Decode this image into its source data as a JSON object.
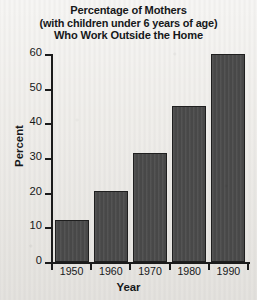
{
  "chart_data": {
    "type": "bar",
    "title": "Percentage of Mothers (with children under 6 years of age) Who Work Outside the Home",
    "title_lines": [
      "Percentage of Mothers",
      "(with children under 6 years of age)",
      "Who Work Outside the Home"
    ],
    "categories": [
      "1950",
      "1960",
      "1970",
      "1980",
      "1990"
    ],
    "values": [
      12,
      20.5,
      31.5,
      45,
      60
    ],
    "xlabel": "Year",
    "ylabel": "Percent",
    "ylim": [
      0,
      60
    ],
    "yticks": [
      "0",
      "10",
      "20",
      "30",
      "40",
      "50",
      "60"
    ],
    "ytick_values": [
      0,
      10,
      20,
      30,
      40,
      50,
      60
    ],
    "grid": false,
    "legend": false,
    "colors": {
      "bar_fill": "#4c4c4c",
      "bar_edge": "#1f1f1f",
      "axis": "#1b1b1b",
      "text": "#16181a",
      "background": "#eceae6"
    }
  }
}
